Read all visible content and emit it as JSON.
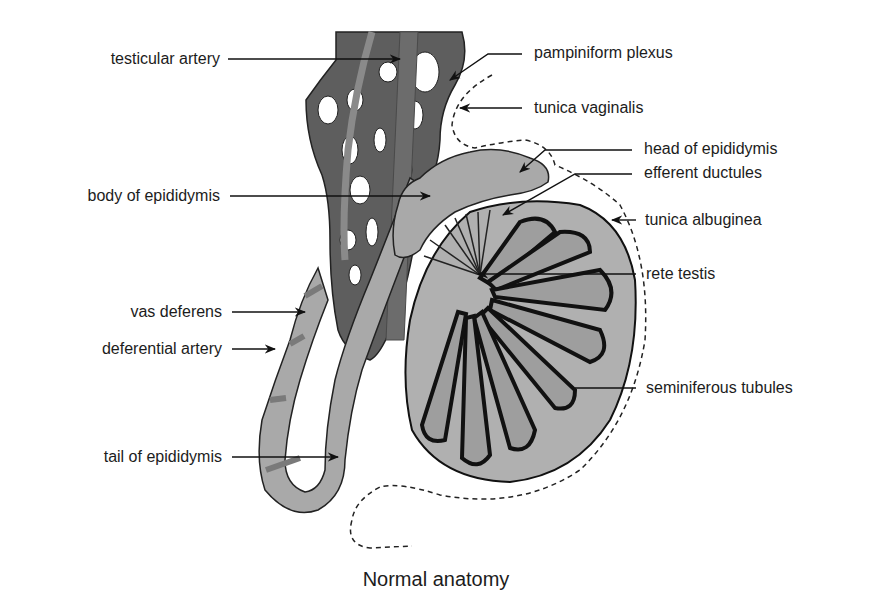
{
  "figure": {
    "caption": "Normal anatomy",
    "colors": {
      "plexus": "#5e5e5e",
      "epididymis": "#a9a9a9",
      "testis": "#b0b0b0",
      "tubule_dark": "#111111",
      "artery_light": "#8a8a8a",
      "outline": "#222222",
      "background": "#ffffff"
    },
    "labels_left": [
      {
        "id": "testicular-artery",
        "text": "testicular artery"
      },
      {
        "id": "body-of-epididymis",
        "text": "body of epididymis"
      },
      {
        "id": "vas-deferens",
        "text": "vas deferens"
      },
      {
        "id": "deferential-artery",
        "text": "deferential artery"
      },
      {
        "id": "tail-of-epididymis",
        "text": "tail of epididymis"
      }
    ],
    "labels_right": [
      {
        "id": "pampiniform-plexus",
        "text": "pampiniform plexus"
      },
      {
        "id": "tunica-vaginalis",
        "text": "tunica vaginalis"
      },
      {
        "id": "head-of-epididymis",
        "text": "head of epididymis"
      },
      {
        "id": "efferent-ductules",
        "text": "efferent ductules"
      },
      {
        "id": "tunica-albuginea",
        "text": "tunica albuginea"
      },
      {
        "id": "rete-testis",
        "text": "rete testis"
      },
      {
        "id": "seminiferous-tubules",
        "text": "seminiferous tubules"
      }
    ]
  }
}
